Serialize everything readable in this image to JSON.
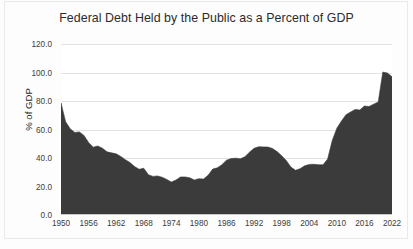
{
  "chart_data": {
    "type": "area",
    "title": "Federal Debt Held by the Public as a Percent of GDP",
    "xlabel": "",
    "ylabel": "% of GDP",
    "ylim": [
      0.0,
      120.0
    ],
    "xlim": [
      1950,
      2022
    ],
    "ytick_labels": [
      "0.0",
      "20.0",
      "40.0",
      "60.0",
      "80.0",
      "100.0",
      "120.0"
    ],
    "ytick_values": [
      0.0,
      20.0,
      40.0,
      60.0,
      80.0,
      100.0,
      120.0
    ],
    "xtick_labels": [
      "1950",
      "1956",
      "1962",
      "1968",
      "1974",
      "1980",
      "1986",
      "1992",
      "1998",
      "2004",
      "2010",
      "2016",
      "2022"
    ],
    "xtick_values": [
      1950,
      1956,
      1962,
      1968,
      1974,
      1980,
      1986,
      1992,
      1998,
      2004,
      2010,
      2016,
      2022
    ],
    "grid": true,
    "legend": false,
    "series_color": "#3b3b3b",
    "series": [
      {
        "name": "Federal Debt Held by the Public",
        "x": [
          1950,
          1951,
          1952,
          1953,
          1954,
          1955,
          1956,
          1957,
          1958,
          1959,
          1960,
          1961,
          1962,
          1963,
          1964,
          1965,
          1966,
          1967,
          1968,
          1969,
          1970,
          1971,
          1972,
          1973,
          1974,
          1975,
          1976,
          1977,
          1978,
          1979,
          1980,
          1981,
          1982,
          1983,
          1984,
          1985,
          1986,
          1987,
          1988,
          1989,
          1990,
          1991,
          1992,
          1993,
          1994,
          1995,
          1996,
          1997,
          1998,
          1999,
          2000,
          2001,
          2002,
          2003,
          2004,
          2005,
          2006,
          2007,
          2008,
          2009,
          2010,
          2011,
          2012,
          2013,
          2014,
          2015,
          2016,
          2017,
          2018,
          2019,
          2020,
          2021,
          2022
        ],
        "values": [
          78.6,
          65.5,
          60.5,
          57.9,
          58.3,
          55.8,
          50.9,
          47.6,
          48.4,
          46.9,
          44.3,
          43.6,
          42.9,
          41.1,
          38.8,
          36.8,
          34.0,
          32.1,
          32.8,
          28.3,
          27.1,
          27.4,
          26.5,
          25.0,
          23.1,
          24.5,
          26.7,
          26.7,
          26.1,
          24.6,
          25.5,
          25.2,
          27.9,
          32.2,
          33.1,
          35.3,
          38.5,
          39.6,
          39.9,
          39.4,
          40.9,
          44.1,
          46.8,
          47.9,
          47.8,
          47.7,
          46.7,
          44.5,
          41.6,
          38.2,
          33.7,
          31.4,
          32.5,
          34.5,
          35.5,
          35.6,
          35.3,
          35.2,
          39.3,
          52.3,
          60.9,
          65.9,
          70.4,
          72.3,
          74.1,
          73.7,
          76.5,
          76.1,
          77.8,
          79.3,
          100.3,
          99.6,
          97.0
        ],
        "start_value": 78.6,
        "trough_value": 23.1,
        "trough_year": 1974,
        "mid_peak_value": 47.9,
        "mid_peak_year": 1993,
        "peak_value": 100.3,
        "peak_year": 2020,
        "end_value": 97.0,
        "end_year": 2022
      }
    ]
  },
  "footer": {
    "source_note": ""
  }
}
